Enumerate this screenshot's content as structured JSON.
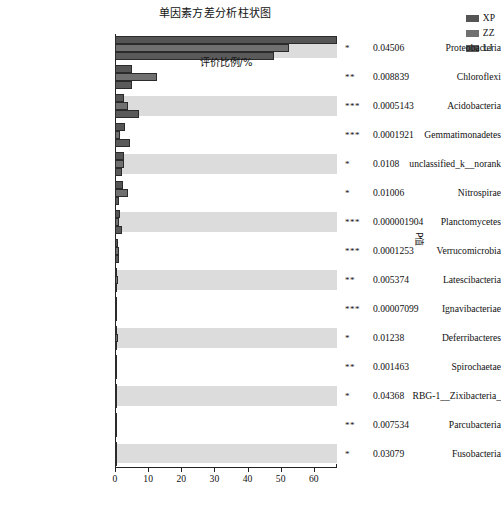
{
  "chart_data": {
    "type": "bar",
    "orientation": "horizontal",
    "title": "单因素方差分析柱状图",
    "xlabel": "评价比例/%",
    "ylabel": "",
    "right_axis_label": "P值",
    "xlim": [
      0,
      67
    ],
    "xticks": [
      0,
      10,
      20,
      30,
      40,
      50,
      60
    ],
    "xtick_labels": [
      "0",
      "10",
      "20",
      "30",
      "40",
      "50",
      "60"
    ],
    "grid": false,
    "legend_position": "top-right",
    "categories": [
      "Proteobacteria",
      "Chloroflexi",
      "Acidobacteria",
      "Gemmatimonadetes",
      "unclassified_k__norank",
      "Nitrospirae",
      "Planctomycetes",
      "Verrucomicrobia",
      "Latescibacteria",
      "Ignavibacteriae",
      "Deferribacteres",
      "Spirochaetae",
      "RBG-1__Zixibacteria_",
      "Parcubacteria",
      "Fusobacteria"
    ],
    "series": [
      {
        "name": "XP",
        "color": "#555555",
        "values": [
          67.0,
          5.1,
          2.7,
          3.0,
          2.6,
          2.3,
          1.6,
          1.0,
          0.5,
          0.35,
          0.45,
          0.3,
          0.3,
          0.2,
          0.25
        ]
      },
      {
        "name": "ZZ",
        "color": "#707070",
        "values": [
          52.5,
          12.8,
          4.0,
          1.6,
          2.8,
          4.0,
          1.2,
          1.1,
          0.9,
          0.3,
          0.8,
          0.25,
          0.2,
          0.15,
          0.2
        ]
      },
      {
        "name": "LJ",
        "color": "#5a5a5a",
        "values": [
          48.0,
          5.0,
          7.3,
          4.4,
          2.1,
          1.3,
          2.0,
          1.3,
          0.5,
          0.3,
          0.4,
          0.2,
          0.25,
          0.15,
          0.2
        ]
      }
    ],
    "significance": [
      "*",
      "**",
      "***",
      "***",
      "*",
      "*",
      "***",
      "***",
      "**",
      "***",
      "*",
      "**",
      "*",
      "**",
      "*"
    ],
    "p_values": [
      "0.04506",
      "0.008839",
      "0.0005143",
      "0.0001921",
      "0.0108",
      "0.01006",
      "0.000001904",
      "0.0001253",
      "0.005374",
      "0.00007099",
      "0.01238",
      "0.001463",
      "0.04368",
      "0.007534",
      "0.03079"
    ],
    "band_color": "#dcdcdc",
    "bar_edge_color": "#2b2b2b",
    "background": "#ffffff"
  },
  "legend": {
    "items": [
      {
        "label": "XP",
        "color": "#555555"
      },
      {
        "label": "ZZ",
        "color": "#707070"
      },
      {
        "label": "LJ",
        "color": "#5a5a5a"
      }
    ]
  }
}
